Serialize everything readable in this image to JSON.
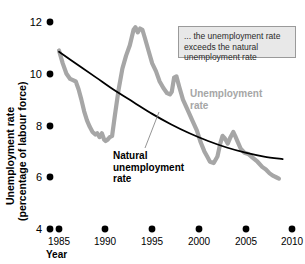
{
  "chart_data": {
    "type": "line",
    "title": "",
    "xlabel": "Year",
    "ylabel": "Unemployment rate (percentage of labour force)",
    "xlim": [
      1984.2,
      2010.0
    ],
    "ylim": [
      4,
      12
    ],
    "grid": false,
    "legend_position": "inline-labels",
    "xticks": [
      "1985",
      "1990",
      "1995",
      "2000",
      "2005",
      "2010"
    ],
    "xtick_values": [
      1985,
      1990,
      1995,
      2000,
      2005,
      2010
    ],
    "yticks": [
      "4",
      "6",
      "8",
      "10",
      "12"
    ],
    "ytick_values": [
      4,
      6,
      8,
      10,
      12
    ],
    "series": [
      {
        "name": "Unemployment rate",
        "color": "#a6a6a6",
        "x": [
          1985.0,
          1985.4,
          1985.8,
          1986.2,
          1986.5,
          1986.8,
          1987.1,
          1987.4,
          1987.7,
          1988.0,
          1988.3,
          1988.6,
          1988.9,
          1989.1,
          1989.35,
          1989.6,
          1989.85,
          1990.0,
          1990.2,
          1990.45,
          1990.7,
          1991.0,
          1991.4,
          1991.8,
          1992.2,
          1992.6,
          1993.0,
          1993.2,
          1993.45,
          1993.7,
          1993.95,
          1994.2,
          1994.6,
          1995.0,
          1995.4,
          1995.8,
          1996.2,
          1996.6,
          1996.9,
          1997.1,
          1997.35,
          1997.6,
          1997.9,
          1998.3,
          1998.8,
          1999.3,
          1999.8,
          2000.2,
          2000.6,
          2000.9,
          2001.2,
          2001.6,
          2002.0,
          2002.3,
          2002.55,
          2002.8,
          2003.1,
          2003.4,
          2003.7,
          2003.9,
          2004.2,
          2004.5,
          2004.9,
          2005.3,
          2005.8,
          2006.3,
          2006.8,
          2007.2,
          2007.6,
          2008.0,
          2008.3,
          2008.6
        ],
        "y": [
          10.9,
          10.4,
          10.0,
          9.8,
          9.75,
          9.7,
          9.4,
          9.0,
          8.55,
          8.2,
          7.95,
          7.75,
          7.65,
          7.7,
          7.55,
          7.7,
          7.45,
          7.4,
          7.45,
          7.55,
          7.6,
          8.4,
          9.4,
          10.2,
          10.7,
          11.1,
          11.7,
          11.8,
          11.6,
          11.75,
          11.7,
          11.4,
          10.9,
          10.4,
          10.1,
          9.7,
          9.45,
          9.25,
          9.2,
          9.3,
          9.85,
          9.9,
          9.5,
          9.0,
          8.6,
          8.2,
          7.8,
          7.35,
          7.0,
          6.8,
          6.6,
          6.55,
          6.8,
          7.3,
          7.6,
          7.5,
          7.3,
          7.55,
          7.75,
          7.6,
          7.35,
          7.1,
          6.95,
          6.9,
          6.75,
          6.6,
          6.4,
          6.3,
          6.15,
          6.05,
          6.0,
          5.95
        ]
      },
      {
        "name": "Natural unemployment rate",
        "color": "#000000",
        "x": [
          1985.0,
          1987.0,
          1989.0,
          1991.0,
          1993.0,
          1995.0,
          1997.0,
          1999.0,
          2001.0,
          2003.0,
          2005.0,
          2007.0,
          2009.0
        ],
        "y": [
          10.85,
          10.35,
          9.85,
          9.35,
          8.9,
          8.45,
          8.05,
          7.7,
          7.4,
          7.15,
          6.95,
          6.8,
          6.7
        ]
      }
    ],
    "annotations": [
      {
        "name": "callout-exceeds",
        "text": "... the unemployment rate exceeds the natural unemployment rate"
      }
    ]
  },
  "labels": {
    "unemployment_rate": "Unemployment rate",
    "natural_rate_line1": "Natural",
    "natural_rate_line2": "unemployment",
    "natural_rate_line3": "rate",
    "axis_title_y_line1": "Unemployment rate",
    "axis_title_y_line2": "(percentage of labour force)",
    "axis_title_x": "Year"
  },
  "callout": {
    "text": "... the unemployment rate exceeds the natural unemployment rate"
  },
  "colors": {
    "unemployment_series": "#a6a6a6",
    "natural_series": "#000000",
    "callout_bg": "#e8e8e8",
    "callout_border": "#9a9a9a",
    "background": "#ffffff"
  }
}
